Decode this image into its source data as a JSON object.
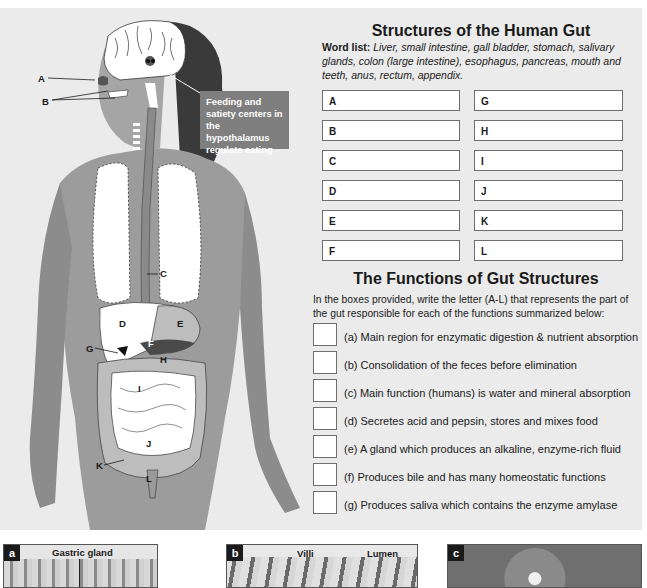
{
  "structures": {
    "title": "Structures of the Human Gut",
    "word_list_label": "Word list:",
    "word_list_text": "Liver, small intestine, gall bladder, stomach, salivary glands, colon (large intestine), esophagus, pancreas, mouth and teeth, anus, rectum, appendix.",
    "boxes_left": [
      "A",
      "B",
      "C",
      "D",
      "E",
      "F"
    ],
    "boxes_right": [
      "G",
      "H",
      "I",
      "J",
      "K",
      "L"
    ]
  },
  "functions": {
    "title": "The Functions of Gut Structures",
    "instructions": "In the boxes provided, write the letter (A-L) that represents the part of the gut responsible for each of the functions summarized below:",
    "items": [
      "(a) Main region for enzymatic digestion & nutrient absorption",
      "(b) Consolidation of the feces before elimination",
      "(c) Main function (humans) is water and mineral absorption",
      "(d) Secretes acid and pepsin, stores and mixes food",
      "(e) A gland which produces an alkaline, enzyme-rich fluid",
      "(f)  Produces bile and has many homeostatic functions",
      "(g) Produces saliva which contains the enzyme amylase"
    ]
  },
  "figure": {
    "callout": "Feeding and satiety centers in the hypothalamus regulate eating",
    "labels": {
      "A": "A",
      "B": "B",
      "C": "C",
      "D": "D",
      "E": "E",
      "F": "F",
      "G": "G",
      "H": "H",
      "I": "I",
      "J": "J",
      "K": "K",
      "L": "L"
    }
  },
  "micrographs": [
    {
      "tag": "a",
      "caption": "Gastric gland"
    },
    {
      "tag": "b",
      "caption_1": "Villi",
      "caption_2": "Lumen"
    },
    {
      "tag": "c"
    }
  ],
  "colors": {
    "panel_bg": "#ebebeb",
    "callout_bg": "#7f7f7f",
    "organ_dark": "#8a8a8a",
    "organ_light": "#bdbdbd"
  }
}
